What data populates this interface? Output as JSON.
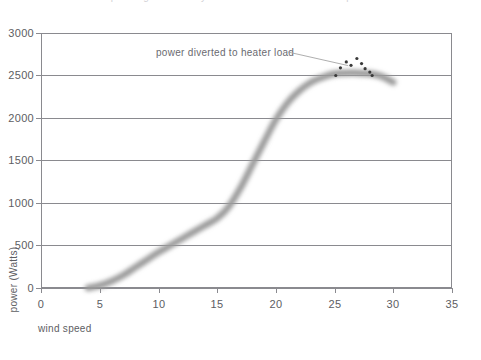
{
  "chart_data": {
    "type": "line",
    "title": "power generated by a wind turbine versus wind speed",
    "xlabel": "wind speed",
    "ylabel": "power (Watts)",
    "xlim": [
      0,
      35
    ],
    "ylim": [
      0,
      3000
    ],
    "xticks": [
      "0",
      "5",
      "10",
      "15",
      "20",
      "25",
      "30",
      "35"
    ],
    "yticks": [
      "0",
      "500",
      "1000",
      "1500",
      "2000",
      "2500",
      "3000"
    ],
    "grid": "horizontal",
    "legend": "none",
    "series": [
      {
        "name": "power output",
        "style": "thick-blurred-gray-line",
        "color": "#9a9a9a",
        "x": [
          4,
          5,
          6,
          7,
          8,
          9,
          10,
          11,
          12,
          13,
          14,
          15,
          16,
          17,
          18,
          19,
          20,
          21,
          22,
          23,
          24,
          25,
          26,
          27,
          28,
          29,
          30
        ],
        "y": [
          0,
          30,
          80,
          150,
          240,
          330,
          420,
          500,
          580,
          660,
          740,
          820,
          960,
          1180,
          1450,
          1720,
          1980,
          2180,
          2320,
          2420,
          2480,
          2520,
          2530,
          2530,
          2520,
          2490,
          2420
        ]
      },
      {
        "name": "heater load diversion points",
        "style": "scatter-dots",
        "color": "#3a3a3a",
        "x": [
          25.1,
          25.5,
          26.0,
          26.4,
          26.9,
          27.3,
          27.6,
          28.0,
          28.2
        ],
        "y": [
          2500,
          2590,
          2660,
          2620,
          2700,
          2640,
          2580,
          2540,
          2500
        ]
      }
    ],
    "annotations": [
      {
        "text": "power diverted to heater load",
        "x": 20.0,
        "y": 2840,
        "leader_to_x": 26.5,
        "leader_to_y": 2640
      }
    ]
  },
  "axis": {
    "y_title": "power (Watts)",
    "x_title": "wind speed",
    "y_tick_labels": [
      "3000",
      "2500",
      "2000",
      "1500",
      "1000",
      "500",
      "0"
    ],
    "x_tick_labels": [
      "0",
      "5",
      "10",
      "15",
      "20",
      "25",
      "30",
      "35"
    ]
  },
  "annotation": {
    "label": "power diverted to heater load"
  },
  "title": {
    "text": "power generated by a wind turbine versus wind speed"
  },
  "colors": {
    "curve": "#9a9a9a",
    "dots": "#3a3a3a",
    "axis": "#8a8a8f",
    "text": "#5d5d62"
  }
}
